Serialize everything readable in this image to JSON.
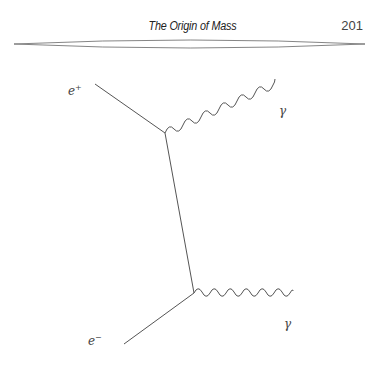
{
  "header": {
    "title": "The Origin of Mass",
    "page_number": "201"
  },
  "diagram": {
    "type": "feynman-diagram",
    "labels": {
      "positron": "e",
      "positron_sup": "+",
      "electron": "e",
      "electron_sup": "−",
      "photon_top": "γ",
      "photon_bottom": "γ"
    }
  }
}
